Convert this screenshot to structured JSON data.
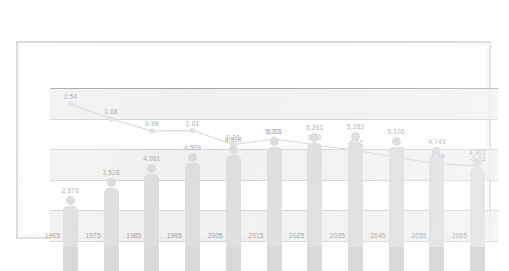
{
  "chart_data": {
    "type": "bar",
    "title": "",
    "xlabel": "",
    "ylabel": "",
    "categories": [
      "1965",
      "1975",
      "1985",
      "1995",
      "2005",
      "2015",
      "2025",
      "2035",
      "2045",
      "2055",
      "2065"
    ],
    "grid": true,
    "legend": "none",
    "series": [
      {
        "name": "population",
        "type": "bar",
        "values": [
          2870,
          3528,
          4081,
          4509,
          4818,
          5101,
          5261,
          5283,
          5105,
          4743,
          4302
        ],
        "labels": [
          "2,870",
          "3,528",
          "4,081",
          "4,509",
          "4,818",
          "5,101",
          "5,261",
          "5,283",
          "5,105",
          "4,743",
          "4,302"
        ],
        "ylim": [
          0,
          6000
        ],
        "color": "#d9d9d9"
      },
      {
        "name": "growth-rate",
        "type": "line",
        "values": [
          2.54,
          1.68,
          0.99,
          1.01,
          0.21,
          0.53,
          0.2,
          -0.12,
          -0.52,
          -0.89,
          -1.03
        ],
        "labels": [
          "2.54",
          "1.68",
          "0.99",
          "1.01",
          "0.21",
          "0.53",
          "0.20",
          "-0.12",
          "-0.52",
          "-0.89",
          "-1.03"
        ],
        "ylim": [
          -2,
          3
        ],
        "color": "#cccccc",
        "marker": "circle"
      }
    ]
  },
  "axis": {
    "tick_labels": [
      "1965",
      "1975",
      "1985",
      "1995",
      "2005",
      "2015",
      "2025",
      "2035",
      "2045",
      "2055",
      "2065"
    ]
  }
}
